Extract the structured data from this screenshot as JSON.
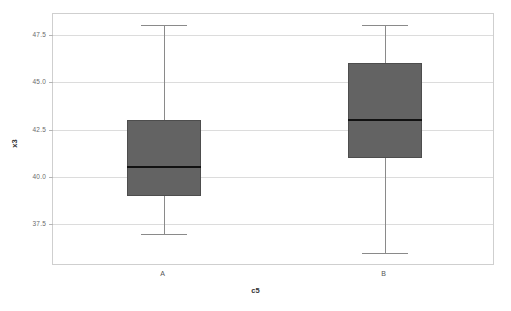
{
  "chart_data": {
    "type": "box",
    "title": "",
    "xlabel": "c5",
    "ylabel": "x3",
    "categories": [
      "A",
      "B"
    ],
    "ylim": [
      35.3,
      48.6
    ],
    "yticks": [
      37.5,
      40.0,
      42.5,
      45.0,
      47.5
    ],
    "ytick_labels": [
      "37.5",
      "40.0",
      "42.5",
      "45.0",
      "47.5"
    ],
    "grid": true,
    "legend": null,
    "box_color": "#636363",
    "median_color": "#111111",
    "whisker_color": "#8a8a8a",
    "boxes": [
      {
        "category": "A",
        "min": 37.0,
        "q1": 39.0,
        "median": 40.5,
        "q3": 43.0,
        "max": 48.0,
        "outliers": []
      },
      {
        "category": "B",
        "min": 36.0,
        "q1": 41.0,
        "median": 43.0,
        "q3": 46.0,
        "max": 48.0,
        "outliers": []
      }
    ]
  }
}
